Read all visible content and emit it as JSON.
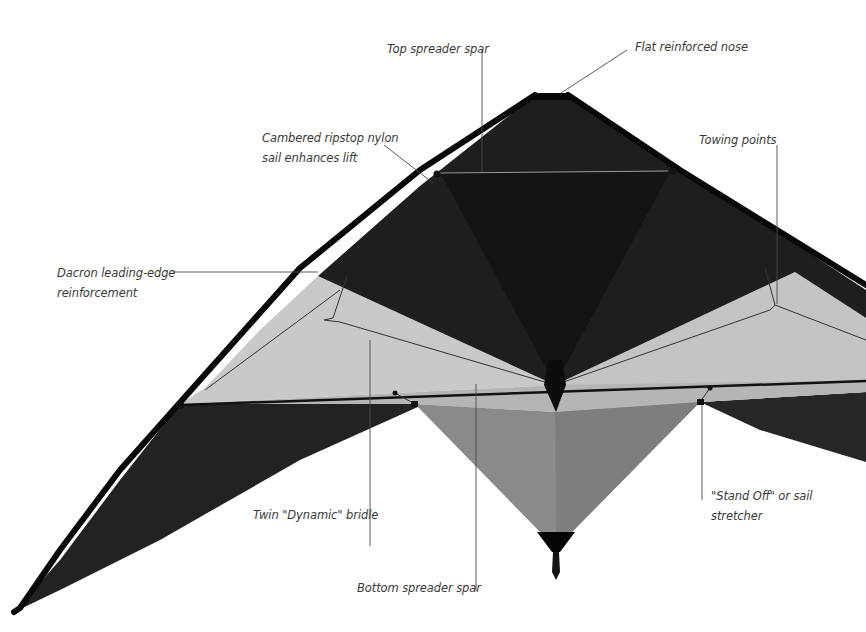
{
  "diagram": {
    "colors": {
      "background": "#ffffff",
      "dark_sail": "#1c1c1c",
      "upper_dark_panel": "#262626",
      "light_panel": "#c8c8c8",
      "mid_panel": "#8c8c8c",
      "leading_edge": "#0a0a0a",
      "leader_line": "#444444",
      "label_text": "#3a3a3a"
    },
    "labels": [
      {
        "id": "top-spreader-spar",
        "line1": "Top spreader spar",
        "line2": ""
      },
      {
        "id": "flat-reinforced-nose",
        "line1": "Flat reinforced nose",
        "line2": ""
      },
      {
        "id": "cambered-sail",
        "line1": "Cambered ripstop nylon",
        "line2": "sail enhances lift"
      },
      {
        "id": "towing-points",
        "line1": "Towing points",
        "line2": ""
      },
      {
        "id": "dacron-reinforcement",
        "line1": "Dacron leading-edge",
        "line2": "reinforcement"
      },
      {
        "id": "twin-bridle",
        "line1": "Twin \"Dynamic\" bridle",
        "line2": ""
      },
      {
        "id": "stand-off",
        "line1": "\"Stand Off\" or sail",
        "line2": "stretcher"
      },
      {
        "id": "bottom-spreader-spar",
        "line1": "Bottom spreader spar",
        "line2": ""
      }
    ]
  }
}
